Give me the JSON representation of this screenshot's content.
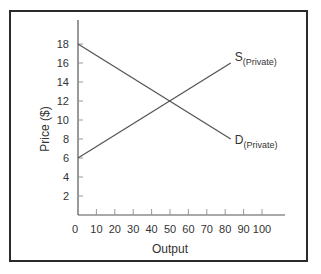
{
  "chart_data": {
    "type": "line",
    "title": "",
    "xlabel": "Output",
    "ylabel": "Price ($)",
    "xlim": [
      0,
      110
    ],
    "ylim": [
      0,
      20
    ],
    "x_ticks": [
      0,
      10,
      20,
      30,
      40,
      50,
      60,
      70,
      80,
      90,
      100
    ],
    "y_ticks": [
      2,
      4,
      6,
      8,
      10,
      12,
      14,
      16,
      18
    ],
    "grid": false,
    "legend": "none (inline labels)",
    "series": [
      {
        "name": "S(Private)",
        "label_main": "S",
        "label_sub": "(Private)",
        "x": [
          0,
          83
        ],
        "y": [
          6,
          16
        ]
      },
      {
        "name": "D(Private)",
        "label_main": "D",
        "label_sub": "(Private)",
        "x": [
          0,
          83
        ],
        "y": [
          18,
          8
        ]
      }
    ],
    "intersection": {
      "x": 50,
      "y": 12
    }
  },
  "colors": {
    "line": "#555555",
    "axis": "#555555",
    "frame": "#2b2b2b",
    "text": "#333333"
  }
}
